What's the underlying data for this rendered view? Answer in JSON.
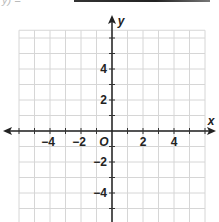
{
  "header": {
    "fragment_text": "y) =",
    "answer_line": true
  },
  "chart_data": {
    "type": "coordinate-grid",
    "title": "",
    "xlabel": "x",
    "ylabel": "y",
    "origin_label": "O",
    "x_range": [
      -6,
      6
    ],
    "y_range": [
      -6,
      6.5
    ],
    "grid": true,
    "grid_step": 1,
    "x_tick_labels": [
      "-4",
      "-2",
      "2",
      "4"
    ],
    "x_tick_values": [
      -4,
      -2,
      2,
      4
    ],
    "y_tick_labels": [
      "4",
      "2",
      "-2",
      "-4"
    ],
    "y_tick_values": [
      4,
      2,
      -2,
      -4
    ],
    "series": [],
    "colors": {
      "grid": "#d6d6d6",
      "axis": "#222222",
      "background": "#ffffff"
    }
  }
}
